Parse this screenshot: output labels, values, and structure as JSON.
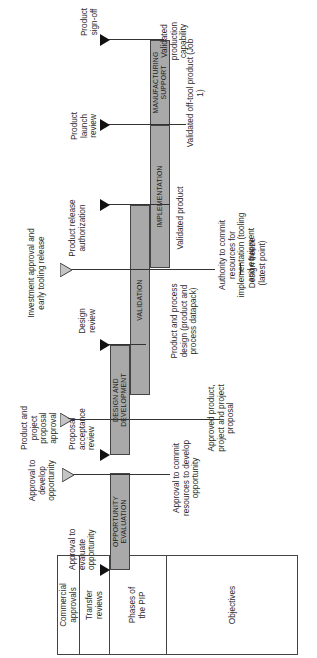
{
  "table": {
    "rows": [
      {
        "label": "Commercial approvals"
      },
      {
        "label": "Transfer reviews"
      },
      {
        "label": "Phases of the PIP"
      },
      {
        "label": "Objectives"
      }
    ]
  },
  "commercial_approvals": [
    {
      "label": "Approval to develop opportunity"
    },
    {
      "label": "Product and project proposal approval"
    },
    {
      "label": "Investment approval and early tooling release"
    }
  ],
  "transfer_reviews": [
    {
      "label": "Approval to evaluate opportunity"
    },
    {
      "label": "Proposal acceptance review"
    },
    {
      "label": "Design review"
    },
    {
      "label": "Product release authorization"
    },
    {
      "label": "Product launch review"
    },
    {
      "label": "Product sign-off"
    }
  ],
  "phases": [
    {
      "label": "OPPORTUNITY EVALUATION"
    },
    {
      "label": "DESIGN AND DEVELOPMENT"
    },
    {
      "label": "VALIDATION"
    },
    {
      "label": "IMPLEMENTATION"
    },
    {
      "label": "MANUFACTURING SUPPORT"
    }
  ],
  "objectives": [
    {
      "label": "Approval to commit resources to develop opportunity"
    },
    {
      "label": "Approved product, project and project proposal"
    },
    {
      "label": "Product and process design (product and process datapack)"
    },
    {
      "label": "Authority to commit resources for implementation (tooling and equipment"
    },
    {
      "label": "Design freeze (latest point)"
    },
    {
      "label": "Validated product"
    },
    {
      "label": "Validated off-tool product (Job 1)"
    },
    {
      "label": "Validated production capability"
    }
  ],
  "colors": {
    "bar_fill": "#a9a9a9",
    "commercial_triangle": "#c4c4c4",
    "transfer_triangle": "#111111",
    "line": "#333333"
  }
}
